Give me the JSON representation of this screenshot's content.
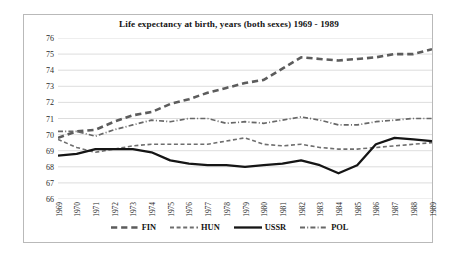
{
  "chart_data": {
    "type": "line",
    "title": "Life expectancy at birth, years (both sexes) 1969 - 1989",
    "xlabel": "",
    "ylabel": "",
    "ylim": [
      66,
      76
    ],
    "yticks": [
      76,
      75,
      74,
      73,
      72,
      71,
      70,
      69,
      68,
      67,
      66
    ],
    "grid": true,
    "legend_position": "bottom",
    "categories": [
      "1969",
      "1970",
      "1971",
      "1972",
      "1973",
      "1974",
      "1975",
      "1976",
      "1977",
      "1978",
      "1979",
      "1980",
      "1981",
      "1982",
      "1983",
      "1984",
      "1985",
      "1986",
      "1987",
      "1988",
      "1989"
    ],
    "series": [
      {
        "name": "FIN",
        "style": "long-dash",
        "color": "#5c5c5c",
        "width": 2.6,
        "values": [
          69.8,
          70.2,
          70.3,
          70.8,
          71.2,
          71.4,
          71.9,
          72.2,
          72.6,
          72.9,
          73.2,
          73.4,
          74.1,
          74.8,
          74.7,
          74.6,
          74.7,
          74.8,
          75.0,
          75.0,
          75.3
        ]
      },
      {
        "name": "HUN",
        "style": "dash",
        "color": "#6e6e6e",
        "width": 1.6,
        "values": [
          69.7,
          69.2,
          68.9,
          69.1,
          69.3,
          69.4,
          69.4,
          69.4,
          69.4,
          69.6,
          69.8,
          69.4,
          69.3,
          69.4,
          69.2,
          69.1,
          69.1,
          69.2,
          69.3,
          69.4,
          69.5
        ]
      },
      {
        "name": "USSR",
        "style": "solid",
        "color": "#151515",
        "width": 2.3,
        "values": [
          68.7,
          68.8,
          69.1,
          69.1,
          69.1,
          68.9,
          68.4,
          68.2,
          68.1,
          68.1,
          68.0,
          68.1,
          68.2,
          68.4,
          68.1,
          67.6,
          68.1,
          69.4,
          69.8,
          69.7,
          69.6
        ]
      },
      {
        "name": "POL",
        "style": "dash-dot",
        "color": "#676767",
        "width": 1.7,
        "values": [
          70.2,
          70.2,
          69.9,
          70.3,
          70.6,
          70.9,
          70.8,
          71.0,
          71.0,
          70.7,
          70.8,
          70.7,
          70.9,
          71.1,
          70.9,
          70.6,
          70.6,
          70.8,
          70.9,
          71.0,
          71.0
        ]
      }
    ]
  },
  "legend": {
    "entries": [
      {
        "label": "FIN"
      },
      {
        "label": "HUN"
      },
      {
        "label": "USSR"
      },
      {
        "label": "POL"
      }
    ]
  }
}
